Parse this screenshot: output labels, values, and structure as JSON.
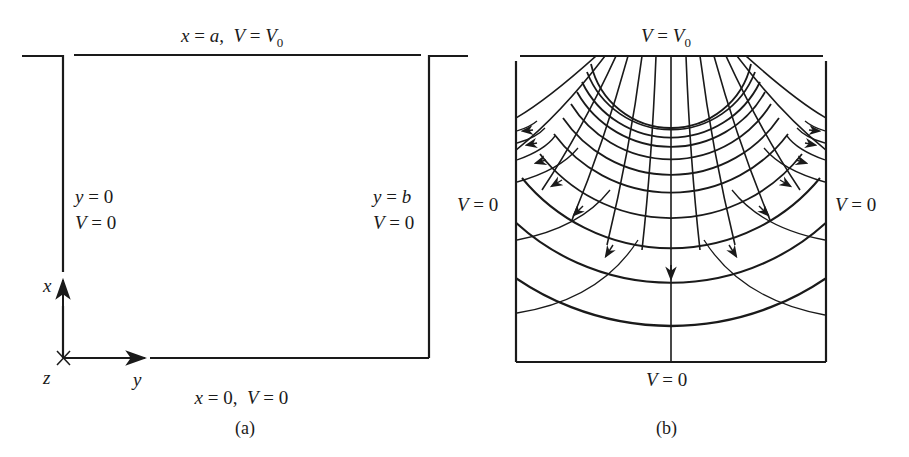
{
  "panel_a": {
    "caption": "(a)",
    "top_label": {
      "var": "x",
      "eq": " = ",
      "val": "a",
      "sep": ",  ",
      "v": "V",
      "eq2": " = ",
      "v0": "V",
      "sub": "0"
    },
    "bottom_label": {
      "var": "x",
      "eq": " = 0,  ",
      "v": "V",
      "eq2": " = 0"
    },
    "left_label": {
      "line1_var": "y",
      "line1_eq": " = 0",
      "line2_var": "V",
      "line2_eq": " = 0"
    },
    "right_label": {
      "line1_var": "y",
      "line1_eq": " = ",
      "line1_val": "b",
      "line2_var": "V",
      "line2_eq": " = 0"
    },
    "axes": {
      "x_axis": "x",
      "y_axis": "y",
      "z_axis": "z"
    }
  },
  "panel_b": {
    "caption": "(b)",
    "top_label": {
      "v": "V",
      "eq": " = ",
      "v0": "V",
      "sub": "0"
    },
    "bottom_label": {
      "v": "V",
      "eq": " = 0"
    },
    "left_label": {
      "v": "V",
      "eq": " = 0"
    },
    "right_label": {
      "v": "V",
      "eq": " = 0"
    },
    "legend": {
      "field_lines": "arrowed curves pointing from V0 plate toward grounded walls",
      "equipotentials": "arcs concentric about the top plate center"
    }
  },
  "colors": {
    "ink": "#1a1a1a",
    "background": "#ffffff"
  }
}
